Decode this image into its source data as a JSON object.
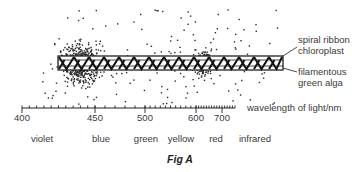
{
  "figure": {
    "caption": "Fig A",
    "axis": {
      "label": "wavelength of light/nm",
      "ticks": [
        {
          "value": "400",
          "x": 22
        },
        {
          "value": "450",
          "x": 95
        },
        {
          "value": "500",
          "x": 145
        },
        {
          "value": "600",
          "x": 196
        },
        {
          "value": "700",
          "x": 222
        }
      ]
    },
    "color_bands": [
      {
        "label": "violet",
        "x": 42
      },
      {
        "label": "blue",
        "x": 101
      },
      {
        "label": "green",
        "x": 146
      },
      {
        "label": "yellow",
        "x": 181
      },
      {
        "label": "red",
        "x": 216
      },
      {
        "label": "infrared",
        "x": 255
      }
    ],
    "annotations": {
      "chloroplast_line1": "spiral ribbon",
      "chloroplast_line2": "chloroplast",
      "alga_line1": "filamentous",
      "alga_line2": "green alga"
    },
    "bacteria_clusters": [
      {
        "name": "violet-blue cluster",
        "cx": 80,
        "cy": 63,
        "rx": 26,
        "ry": 24,
        "count": 520
      },
      {
        "name": "red cluster",
        "cx": 202,
        "cy": 63,
        "rx": 15,
        "ry": 16,
        "count": 170
      },
      {
        "name": "background scatter",
        "cx": 160,
        "cy": 55,
        "rx": 120,
        "ry": 50,
        "count": 170
      }
    ]
  }
}
